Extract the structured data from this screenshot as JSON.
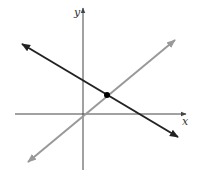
{
  "figure": {
    "type": "coordinate-plane-two-lines",
    "axes": {
      "x_label": "x",
      "y_label": "y",
      "color": "#444444",
      "origin_px": [
        83,
        114
      ]
    },
    "lines": [
      {
        "name": "decreasing-line",
        "color": "#222222",
        "slope_sign": "negative",
        "from_px": [
          22,
          44
        ],
        "to_px": [
          178,
          137
        ],
        "arrows": "both"
      },
      {
        "name": "increasing-line",
        "color": "#999999",
        "slope_sign": "positive",
        "passes_through_origin": true,
        "from_px": [
          28,
          162
        ],
        "to_px": [
          175,
          40
        ],
        "arrows": "both"
      }
    ],
    "intersection_point": {
      "px": [
        107,
        95
      ],
      "color": "#000000"
    }
  }
}
